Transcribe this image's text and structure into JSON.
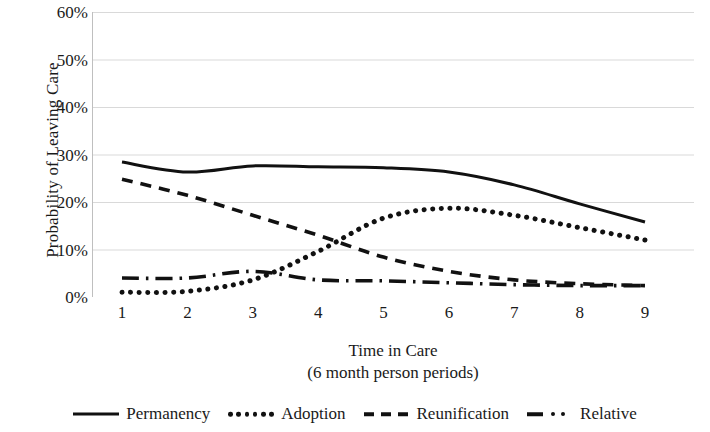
{
  "chart_data": {
    "type": "line",
    "title": "",
    "xlabel": "Time in Care",
    "xlabel_sub": "(6 month person periods)",
    "ylabel": "Probability of Leaving Care",
    "x": [
      1,
      2,
      3,
      4,
      5,
      6,
      7,
      8,
      9
    ],
    "categories": [
      "1",
      "2",
      "3",
      "4",
      "5",
      "6",
      "7",
      "8",
      "9"
    ],
    "xtick_labels": [
      "1",
      "2",
      "3",
      "4",
      "5",
      "6",
      "7",
      "8",
      "9"
    ],
    "ytick_labels": [
      "0%",
      "10%",
      "20%",
      "30%",
      "40%",
      "50%",
      "60%"
    ],
    "ytick_values": [
      0,
      10,
      20,
      30,
      40,
      50,
      60
    ],
    "ylim": [
      0,
      60
    ],
    "xlim": [
      1,
      9
    ],
    "grid": "horizontal",
    "legend_position": "bottom",
    "series": [
      {
        "name": "Permanency",
        "style": "solid",
        "color": "#111111",
        "values": [
          28.4,
          26.3,
          27.6,
          27.4,
          27.2,
          26.3,
          23.6,
          19.6,
          15.8
        ]
      },
      {
        "name": "Adoption",
        "style": "dotted",
        "color": "#111111",
        "values": [
          1.0,
          1.2,
          3.6,
          9.6,
          16.6,
          18.7,
          17.2,
          14.6,
          12.0
        ]
      },
      {
        "name": "Reunification",
        "style": "dashed",
        "color": "#111111",
        "values": [
          24.8,
          21.4,
          17.2,
          13.0,
          8.4,
          5.4,
          3.6,
          2.8,
          2.4
        ]
      },
      {
        "name": "Relative",
        "style": "dashdot",
        "color": "#111111",
        "values": [
          4.0,
          4.0,
          5.4,
          3.6,
          3.4,
          3.0,
          2.6,
          2.4,
          2.4
        ]
      }
    ]
  },
  "legend": {
    "items": [
      {
        "label": "Permanency",
        "style": "solid"
      },
      {
        "label": "Adoption",
        "style": "dotted"
      },
      {
        "label": "Reunification",
        "style": "dashed"
      },
      {
        "label": "Relative",
        "style": "dashdot"
      }
    ]
  },
  "colors": {
    "ink": "#111111",
    "grid": "#d9d9d9",
    "axis": "#bfbfbf",
    "background": "#ffffff"
  }
}
